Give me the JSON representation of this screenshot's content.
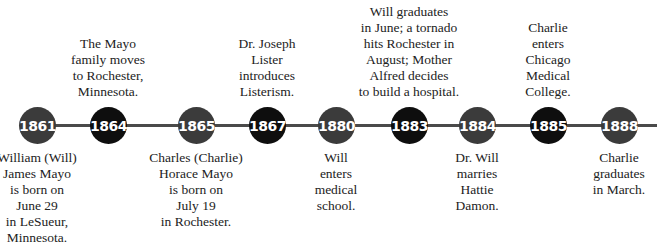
{
  "timeline": {
    "colors": {
      "line": "#4a4a4a",
      "gray_node": "#3b3b3b",
      "black_node": "#0e0e0e"
    },
    "events": [
      {
        "year": "1861",
        "x": 37,
        "tone": "gray",
        "position": "below",
        "text": "William (Will)\nJames Mayo\nis born on\nJune 29\nin LeSueur,\nMinnesota."
      },
      {
        "year": "1864",
        "x": 108,
        "tone": "black",
        "position": "above",
        "text": "The Mayo\nfamily moves\nto Rochester,\nMinnesota."
      },
      {
        "year": "1865",
        "x": 196,
        "tone": "gray",
        "position": "below",
        "text": "Charles (Charlie)\nHorace Mayo\nis born on\nJuly 19\nin Rochester."
      },
      {
        "year": "1867",
        "x": 267,
        "tone": "black",
        "position": "above",
        "text": "Dr. Joseph\nLister\nintroduces\nListerism."
      },
      {
        "year": "1880",
        "x": 336,
        "tone": "gray",
        "position": "below",
        "text": "Will\nenters\nmedical\nschool."
      },
      {
        "year": "1883",
        "x": 409,
        "tone": "black",
        "position": "above",
        "text": "Will graduates\nin June; a tornado\nhits Rochester in\nAugust; Mother\nAlfred decides\nto build a hospital."
      },
      {
        "year": "1884",
        "x": 477,
        "tone": "gray",
        "position": "below",
        "text": "Dr. Will\nmarries\nHattie\nDamon."
      },
      {
        "year": "1885",
        "x": 548,
        "tone": "black",
        "position": "above",
        "text": "Charlie\nenters\nChicago\nMedical\nCollege."
      },
      {
        "year": "1888",
        "x": 619,
        "tone": "gray",
        "position": "below",
        "text": "Charlie\ngraduates\nin March."
      }
    ]
  }
}
